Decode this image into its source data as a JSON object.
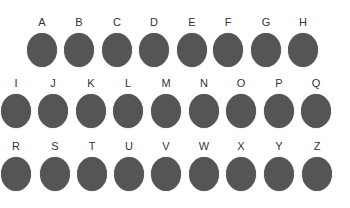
{
  "colors": {
    "dot": "#555555",
    "label": "#333333",
    "background": "#ffffff"
  },
  "rows": [
    {
      "items": [
        {
          "letter": "A",
          "x": 26,
          "y": 16
        },
        {
          "letter": "B",
          "x": 63,
          "y": 16
        },
        {
          "letter": "C",
          "x": 101,
          "y": 16
        },
        {
          "letter": "D",
          "x": 138,
          "y": 16
        },
        {
          "letter": "E",
          "x": 176,
          "y": 16
        },
        {
          "letter": "F",
          "x": 212,
          "y": 16
        },
        {
          "letter": "G",
          "x": 250,
          "y": 16
        },
        {
          "letter": "H",
          "x": 287,
          "y": 16
        }
      ]
    },
    {
      "items": [
        {
          "letter": "I",
          "x": 0,
          "y": 77
        },
        {
          "letter": "J",
          "x": 37,
          "y": 77
        },
        {
          "letter": "K",
          "x": 75,
          "y": 77
        },
        {
          "letter": "L",
          "x": 112,
          "y": 77
        },
        {
          "letter": "M",
          "x": 150,
          "y": 77
        },
        {
          "letter": "N",
          "x": 188,
          "y": 77
        },
        {
          "letter": "O",
          "x": 225,
          "y": 77
        },
        {
          "letter": "P",
          "x": 263,
          "y": 77
        },
        {
          "letter": "Q",
          "x": 300,
          "y": 77
        }
      ]
    },
    {
      "items": [
        {
          "letter": "R",
          "x": 0,
          "y": 140
        },
        {
          "letter": "S",
          "x": 39,
          "y": 140
        },
        {
          "letter": "T",
          "x": 76,
          "y": 140
        },
        {
          "letter": "U",
          "x": 113,
          "y": 140
        },
        {
          "letter": "V",
          "x": 150,
          "y": 140
        },
        {
          "letter": "W",
          "x": 188,
          "y": 140
        },
        {
          "letter": "X",
          "x": 225,
          "y": 140
        },
        {
          "letter": "Y",
          "x": 263,
          "y": 140
        },
        {
          "letter": "Z",
          "x": 301,
          "y": 140
        }
      ]
    }
  ]
}
